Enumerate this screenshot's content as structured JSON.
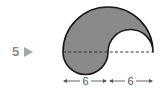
{
  "problem": {
    "number": "5",
    "marker_icon": "right-triangle-icon"
  },
  "figure": {
    "fill_color": "#8a8a8a",
    "stroke_color": "#1a1a1a",
    "dashed_line_color": "#333333",
    "dimensions": [
      {
        "label": "6",
        "segment": "left half of diameter"
      },
      {
        "label": "6",
        "segment": "right half of diameter"
      }
    ]
  }
}
